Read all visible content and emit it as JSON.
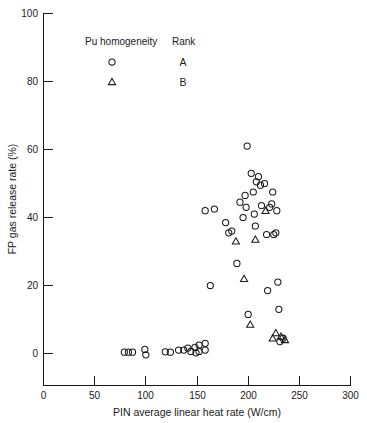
{
  "chart_data": {
    "type": "scatter",
    "title": "",
    "xlabel": "PIN average linear heat rate (W/cm)",
    "ylabel": "FP gas release rate (%)",
    "xlim": [
      0,
      300
    ],
    "ylim": [
      0,
      100
    ],
    "xticks": [
      0,
      50,
      100,
      150,
      200,
      250,
      300
    ],
    "yticks": [
      0,
      20,
      40,
      60,
      80,
      100
    ],
    "xtick_labels": [
      "0",
      "50",
      "100",
      "150",
      "200",
      "250",
      "300"
    ],
    "ytick_labels": [
      "0",
      "20",
      "40",
      "60",
      "80",
      "100"
    ],
    "grid": false,
    "legend_position": "upper-left-inside",
    "legend": {
      "column_headers": [
        "Pu homogeneity",
        "Rank"
      ],
      "entries": [
        {
          "marker": "circle",
          "rank": "A"
        },
        {
          "marker": "triangle",
          "rank": "B"
        }
      ]
    },
    "series": [
      {
        "name": "Rank A",
        "marker": "circle",
        "points": [
          [
            79,
            0.4
          ],
          [
            83,
            0.4
          ],
          [
            87,
            0.4
          ],
          [
            99,
            1.2
          ],
          [
            100,
            -0.4
          ],
          [
            119,
            0.5
          ],
          [
            124,
            0.4
          ],
          [
            132,
            1.0
          ],
          [
            137,
            1.0
          ],
          [
            141,
            1.6
          ],
          [
            144,
            0.6
          ],
          [
            148,
            1.8
          ],
          [
            149,
            0.2
          ],
          [
            152,
            2.5
          ],
          [
            152,
            0.6
          ],
          [
            158,
            3.0
          ],
          [
            158,
            1.0
          ],
          [
            158,
            42.0
          ],
          [
            163,
            20.0
          ],
          [
            167,
            42.5
          ],
          [
            178,
            38.5
          ],
          [
            181,
            35.5
          ],
          [
            184,
            36.0
          ],
          [
            189,
            26.5
          ],
          [
            192,
            44.5
          ],
          [
            195,
            40.0
          ],
          [
            197,
            46.5
          ],
          [
            198,
            43.0
          ],
          [
            199,
            61.0
          ],
          [
            200,
            11.5
          ],
          [
            203,
            53.0
          ],
          [
            205,
            47.5
          ],
          [
            206,
            41.0
          ],
          [
            207,
            37.5
          ],
          [
            208,
            50.5
          ],
          [
            210,
            52.0
          ],
          [
            212,
            49.5
          ],
          [
            213,
            43.5
          ],
          [
            216,
            50.0
          ],
          [
            218,
            35.0
          ],
          [
            219,
            18.5
          ],
          [
            221,
            43.0
          ],
          [
            223,
            44.0
          ],
          [
            224,
            47.5
          ],
          [
            225,
            35.0
          ],
          [
            227,
            35.5
          ],
          [
            228,
            42.0
          ],
          [
            229,
            21.0
          ],
          [
            230,
            13.0
          ],
          [
            231,
            3.5
          ],
          [
            234,
            4.5
          ]
        ]
      },
      {
        "name": "Rank B",
        "marker": "triangle",
        "points": [
          [
            188,
            33.0
          ],
          [
            196,
            22.0
          ],
          [
            202,
            8.5
          ],
          [
            207,
            33.5
          ],
          [
            217,
            42.0
          ],
          [
            224,
            4.5
          ],
          [
            227,
            6.0
          ],
          [
            232,
            5.0
          ],
          [
            236,
            4.0
          ]
        ]
      }
    ],
    "annotations": []
  }
}
